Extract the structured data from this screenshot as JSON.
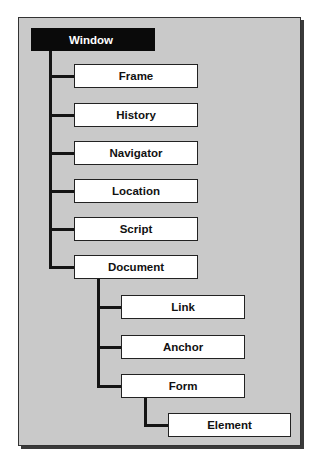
{
  "diagram": {
    "type": "hierarchy-tree",
    "colors": {
      "panel": "#c9c9c9",
      "root_fill": "#0a0a0a",
      "node_fill": "#ffffff",
      "line": "#141414"
    },
    "root": {
      "label": "Window"
    },
    "level1": [
      {
        "label": "Frame"
      },
      {
        "label": "History"
      },
      {
        "label": "Navigator"
      },
      {
        "label": "Location"
      },
      {
        "label": "Script"
      },
      {
        "label": "Document"
      }
    ],
    "document_children": [
      {
        "label": "Link"
      },
      {
        "label": "Anchor"
      },
      {
        "label": "Form"
      }
    ],
    "form_children": [
      {
        "label": "Element"
      }
    ]
  }
}
